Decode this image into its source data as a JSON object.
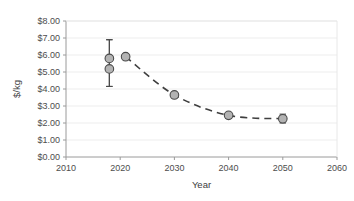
{
  "chart_data": {
    "type": "scatter",
    "title": "",
    "xlabel": "Year",
    "ylabel": "$/kg",
    "xlim": [
      2010,
      2060
    ],
    "ylim": [
      0,
      8
    ],
    "xticks": [
      2010,
      2020,
      2030,
      2040,
      2050,
      2060
    ],
    "xtick_labels": [
      "2010",
      "2020",
      "2030",
      "2040",
      "2050",
      "2060"
    ],
    "yticks": [
      0,
      1,
      2,
      3,
      4,
      5,
      6,
      7,
      8
    ],
    "ytick_labels": [
      "$0.00",
      "$1.00",
      "$2.00",
      "$3.00",
      "$4.00",
      "$5.00",
      "$6.00",
      "$7.00",
      "$8.00"
    ],
    "grid": true,
    "grid_axis": "y",
    "legend": "none",
    "marker_style": "circle",
    "marker_fill": "#b3b3b3",
    "marker_edge": "#4a4a4a",
    "line_style": "dashed",
    "line_color": "#3f3f3f",
    "points": [
      {
        "x": 2018,
        "y": 5.8,
        "yerr_low": 4.15,
        "yerr_high": 6.9,
        "has_error_bar": true
      },
      {
        "x": 2018,
        "y": 5.18,
        "yerr_low": 4.15,
        "yerr_high": 6.9,
        "has_error_bar": true
      },
      {
        "x": 2021,
        "y": 5.9,
        "has_error_bar": false
      },
      {
        "x": 2030,
        "y": 3.65,
        "has_error_bar": false
      },
      {
        "x": 2040,
        "y": 2.45,
        "yerr_low": 2.28,
        "yerr_high": 2.62,
        "has_error_bar": true
      },
      {
        "x": 2050,
        "y": 2.25,
        "yerr_low": 2.0,
        "yerr_high": 2.52,
        "has_error_bar": true
      }
    ],
    "trend_line": [
      {
        "x": 2021,
        "y": 5.9
      },
      {
        "x": 2030,
        "y": 3.65
      },
      {
        "x": 2040,
        "y": 2.45
      },
      {
        "x": 2050,
        "y": 2.25
      }
    ]
  }
}
